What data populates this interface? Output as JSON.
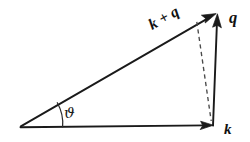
{
  "figure": {
    "name": "vector-addition-triangle",
    "background_color": "#ffffff",
    "ink_color": "#1a1a1a"
  },
  "labels": {
    "hypotenuse": "k + q",
    "vertical": "q",
    "horizontal": "k",
    "angle": "ϑ"
  },
  "geometry": {
    "origin": {
      "x": 20,
      "y": 127
    },
    "corner_right": {
      "x": 213,
      "y": 126
    },
    "apex": {
      "x": 217,
      "y": 14
    },
    "dashed_top": {
      "x": 197,
      "y": 22
    },
    "dashed_bottom": {
      "x": 211,
      "y": 121
    },
    "arc_radius": 42,
    "angle_degrees": 30
  },
  "label_positions": {
    "hypotenuse": {
      "x": 152,
      "y": 30,
      "rotate": -29
    },
    "vertical": {
      "x": 229,
      "y": 22
    },
    "horizontal": {
      "x": 224,
      "y": 133
    },
    "angle": {
      "x": 64,
      "y": 117
    }
  }
}
